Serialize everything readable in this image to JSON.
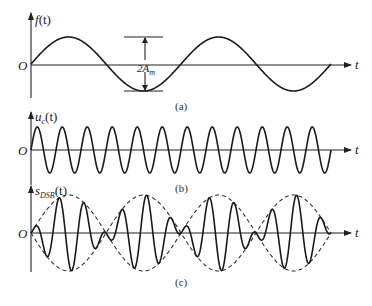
{
  "panels": [
    {
      "id": "a",
      "caption": "(a)",
      "ylabel_main": "f",
      "ylabel_sub": "",
      "ylabel_arg": "(t)",
      "origin_label": "O",
      "xlabel": "t",
      "signal": "modulating sine, 2 periods",
      "cycles": 2,
      "amplitude_annotation": {
        "main": "2A",
        "sub": "m"
      }
    },
    {
      "id": "b",
      "caption": "(b)",
      "ylabel_main": "u",
      "ylabel_sub": "c",
      "ylabel_arg": "(t)",
      "origin_label": "O",
      "xlabel": "t",
      "signal": "carrier sine",
      "cycles": 12
    },
    {
      "id": "c",
      "caption": "(c)",
      "ylabel_main": "s",
      "ylabel_sub": "DSB",
      "ylabel_arg": "(t)",
      "origin_label": "O",
      "xlabel": "t",
      "signal": "DSB modulated signal with dashed envelope",
      "envelope_cycles": 2,
      "carrier_cycles": 12
    }
  ]
}
